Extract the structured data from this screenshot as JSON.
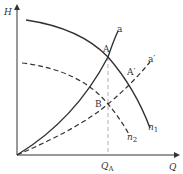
{
  "diagram": {
    "axes": {
      "y_label": "H",
      "x_label": "Q"
    },
    "curves": {
      "n1": {
        "label": "n",
        "sub": "1",
        "style": "solid"
      },
      "n2": {
        "label": "n",
        "sub": "2",
        "style": "dashed"
      },
      "a": {
        "label": "a",
        "style": "solid"
      },
      "a_prime": {
        "label": "a′",
        "style": "dashed"
      }
    },
    "points": {
      "A": "A",
      "A_prime": "A′",
      "B": "B"
    },
    "x_marker": {
      "label": "Q",
      "sub": "A"
    },
    "colors": {
      "line": "#333333",
      "dashed_guide": "#999999"
    }
  }
}
